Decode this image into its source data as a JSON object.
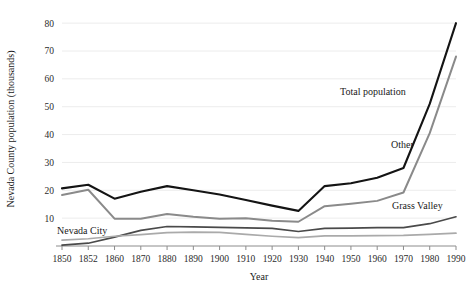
{
  "chart_data": {
    "type": "line",
    "title": "",
    "xlabel": "Year",
    "ylabel": "Nevada County population (thousands)",
    "categories": [
      "1850",
      "1852",
      "1860",
      "1870",
      "1880",
      "1890",
      "1900",
      "1910",
      "1920",
      "1930",
      "1940",
      "1950",
      "1960",
      "1970",
      "1980",
      "1990"
    ],
    "yticks": [
      10,
      20,
      30,
      40,
      50,
      60,
      70,
      80
    ],
    "ylim": [
      0,
      84
    ],
    "grid": true,
    "legend_position": "inline-annotations",
    "series": [
      {
        "name": "Total population",
        "color": "#141414",
        "width": 2.1,
        "label_x": "1965",
        "values": [
          20.7,
          22.0,
          17.0,
          19.5,
          21.5,
          20.0,
          18.5,
          16.5,
          14.5,
          12.6,
          21.5,
          22.5,
          24.5,
          28.0,
          51.0,
          80.0
        ]
      },
      {
        "name": "Other",
        "color": "#8a8a8a",
        "width": 2.0,
        "label_x": "1978",
        "values": [
          18.3,
          20.2,
          9.8,
          9.8,
          11.5,
          10.5,
          9.8,
          10.0,
          9.1,
          8.7,
          14.3,
          15.2,
          16.2,
          19.2,
          40.5,
          68.0
        ]
      },
      {
        "name": "Grass Valley",
        "color": "#4a4a4a",
        "width": 1.7,
        "label_x": "1976",
        "values": [
          0.3,
          1.0,
          3.2,
          5.6,
          7.0,
          6.9,
          6.7,
          6.5,
          6.3,
          5.2,
          6.3,
          6.4,
          6.6,
          6.6,
          8.0,
          10.5
        ]
      },
      {
        "name": "Nevada City",
        "color": "#aaaaaa",
        "width": 1.7,
        "label_x": "1852",
        "values": [
          2.1,
          2.6,
          3.5,
          4.1,
          4.8,
          5.0,
          4.9,
          4.2,
          3.5,
          3.0,
          3.6,
          3.6,
          3.7,
          3.8,
          4.2,
          4.6
        ]
      }
    ]
  },
  "annotations": [
    {
      "name": "Total population",
      "text": "Total population"
    },
    {
      "name": "Other",
      "text": "Other"
    },
    {
      "name": "Grass Valley",
      "text": "Grass Valley"
    },
    {
      "name": "Nevada City",
      "text": "Nevada City"
    }
  ]
}
